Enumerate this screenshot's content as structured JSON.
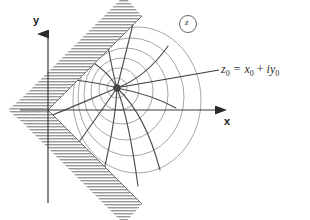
{
  "figure": {
    "background": "#ffffff",
    "width": 310,
    "height": 220
  },
  "axes": {
    "x_label": "x",
    "y_label": "y",
    "origin": [
      48,
      110
    ],
    "x_axis_end": [
      228,
      110
    ],
    "y_axis_top": [
      48,
      26
    ],
    "y_axis_bottom": [
      48,
      203
    ],
    "axis_color": "#3a3a3a"
  },
  "plane_marker": {
    "label": "z",
    "shape": "circle",
    "center": [
      188,
      24
    ],
    "radius": 9,
    "stroke": "#555555"
  },
  "point": {
    "label_z": "z",
    "label_z_sub": "0",
    "equals": "=",
    "label_x": "x",
    "label_x_sub": "0",
    "plus": "+",
    "label_i": "i",
    "label_y": "y",
    "label_y_sub": "0",
    "full_text": "z0 = x0 + iy0",
    "dot_center": [
      117,
      88
    ],
    "dot_radius": 3.2,
    "dot_color": "#4a4a4a",
    "leader_from": [
      120,
      88
    ],
    "leader_to": [
      218,
      70
    ]
  },
  "wedge": {
    "description": "sector apex at origin opening toward +x, half-angle 45 degrees",
    "apex": [
      48,
      110
    ],
    "half_angle_deg": 45,
    "hatch_color": "#9a9a9a",
    "hatch_band_width": 26,
    "boundary_color": "#7d7d7d"
  },
  "curves": {
    "equipotential_color": "#9b9b9b",
    "streamline_color": "#4e4e4e",
    "equipotential_count": 6,
    "streamline_count": 9
  },
  "colors": {
    "ink": "#2a2a2a",
    "gray_light": "#9b9b9b",
    "gray_mid": "#7d7d7d",
    "gray_dark": "#4e4e4e"
  }
}
